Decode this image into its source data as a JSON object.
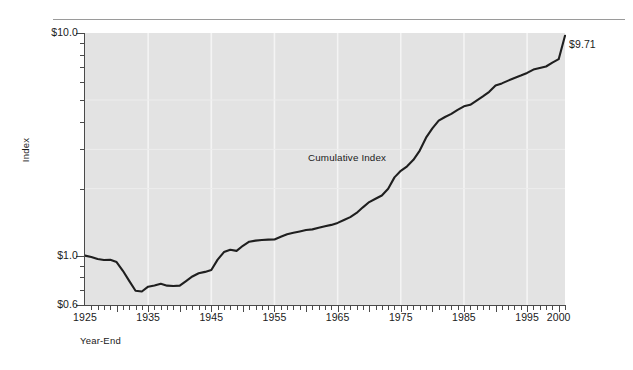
{
  "chart_data": {
    "type": "line",
    "title": "",
    "xlabel": "Year-End",
    "ylabel": "Index",
    "yscale": "log",
    "ylim": [
      0.6,
      10.0
    ],
    "xlim": [
      1925,
      2001
    ],
    "grid": "vertical-decade",
    "legend": "none",
    "annotations": [
      {
        "text": "Cumulative Index",
        "x": 1965,
        "y": 2.1
      },
      {
        "text": "$9.71",
        "x": 2001,
        "y": 9.71
      }
    ],
    "y_tick_labels": [
      "$10.0",
      "$1.0",
      "$0.6"
    ],
    "y_tick_values": [
      10.0,
      1.0,
      0.6
    ],
    "y_minor_ticks": [
      9,
      8,
      7,
      6,
      5,
      4,
      3,
      2,
      0.9,
      0.8,
      0.7
    ],
    "x_tick_labels": [
      "1925",
      "1935",
      "1945",
      "1955",
      "1965",
      "1975",
      "1985",
      "1995",
      "2000"
    ],
    "x_tick_values": [
      1925,
      1935,
      1945,
      1955,
      1965,
      1975,
      1985,
      1995,
      2000
    ],
    "series": [
      {
        "name": "Cumulative Index",
        "color": "#1f1f1f",
        "x": [
          1925,
          1926,
          1927,
          1928,
          1929,
          1930,
          1931,
          1932,
          1933,
          1934,
          1935,
          1936,
          1937,
          1938,
          1939,
          1940,
          1941,
          1942,
          1943,
          1944,
          1945,
          1946,
          1947,
          1948,
          1949,
          1950,
          1951,
          1952,
          1953,
          1954,
          1955,
          1956,
          1957,
          1958,
          1959,
          1960,
          1961,
          1962,
          1963,
          1964,
          1965,
          1966,
          1967,
          1968,
          1969,
          1970,
          1971,
          1972,
          1973,
          1974,
          1975,
          1976,
          1977,
          1978,
          1979,
          1980,
          1981,
          1982,
          1983,
          1984,
          1985,
          1986,
          1987,
          1988,
          1989,
          1990,
          1991,
          1992,
          1993,
          1994,
          1995,
          1996,
          1997,
          1998,
          1999,
          2000,
          2001
        ],
        "y": [
          1.0,
          0.985,
          0.965,
          0.955,
          0.957,
          0.935,
          0.855,
          0.77,
          0.695,
          0.69,
          0.725,
          0.734,
          0.747,
          0.733,
          0.73,
          0.733,
          0.768,
          0.806,
          0.833,
          0.845,
          0.861,
          0.959,
          1.037,
          1.063,
          1.05,
          1.107,
          1.155,
          1.168,
          1.175,
          1.18,
          1.181,
          1.216,
          1.248,
          1.267,
          1.284,
          1.303,
          1.312,
          1.334,
          1.356,
          1.374,
          1.403,
          1.445,
          1.489,
          1.554,
          1.648,
          1.74,
          1.801,
          1.863,
          1.997,
          2.246,
          2.403,
          2.519,
          2.693,
          2.964,
          3.387,
          3.726,
          4.037,
          4.195,
          4.333,
          4.513,
          4.684,
          4.756,
          4.971,
          5.19,
          5.442,
          5.811,
          5.937,
          6.109,
          6.282,
          6.437,
          6.615,
          6.851,
          6.965,
          7.072,
          7.364,
          7.628,
          9.71
        ]
      }
    ]
  },
  "axis": {
    "y_title": "Index",
    "x_title": "Year-End"
  }
}
